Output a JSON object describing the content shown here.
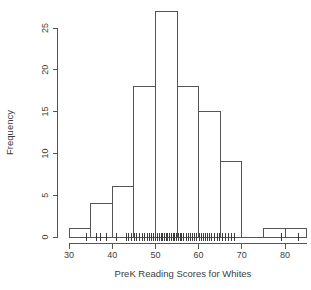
{
  "figure": {
    "background": "#ffffff",
    "line_color": "#555555",
    "text_color": "#3d3d3d"
  },
  "chart_data": {
    "type": "bar",
    "subtype": "histogram",
    "title": "",
    "xlabel": "PreK Reading Scores for Whites",
    "ylabel": "Frequency",
    "breaks": [
      30,
      35,
      40,
      45,
      50,
      55,
      60,
      65,
      70,
      75,
      80,
      85
    ],
    "counts": [
      1,
      4,
      6,
      18,
      27,
      18,
      15,
      9,
      0,
      1,
      1
    ],
    "x_ticks": [
      30,
      40,
      50,
      60,
      70,
      80
    ],
    "y_ticks": [
      0,
      5,
      10,
      15,
      20,
      25
    ],
    "xlim": [
      30,
      85
    ],
    "ylim": [
      0,
      27
    ],
    "grid": false,
    "legend": null,
    "bar_fill": "#ffffff",
    "rug_values": [
      34,
      36.3,
      37.4,
      38.6,
      41,
      43.2,
      43.8,
      44.5,
      45.1,
      45.7,
      46.3,
      46.9,
      47.5,
      48.1,
      48.6,
      49.1,
      49.6,
      50.1,
      50.5,
      50.9,
      51.3,
      51.7,
      52.1,
      52.5,
      52.9,
      53.3,
      53.7,
      54.1,
      54.5,
      54.9,
      55.3,
      55.7,
      56.1,
      56.6,
      57.1,
      57.6,
      58.1,
      58.6,
      59.1,
      59.6,
      60.1,
      60.6,
      61.1,
      61.6,
      62.1,
      62.6,
      63.1,
      63.7,
      64.3,
      64.9,
      65.6,
      66.3,
      67,
      67.7,
      68.4,
      79.3,
      83.2
    ]
  }
}
